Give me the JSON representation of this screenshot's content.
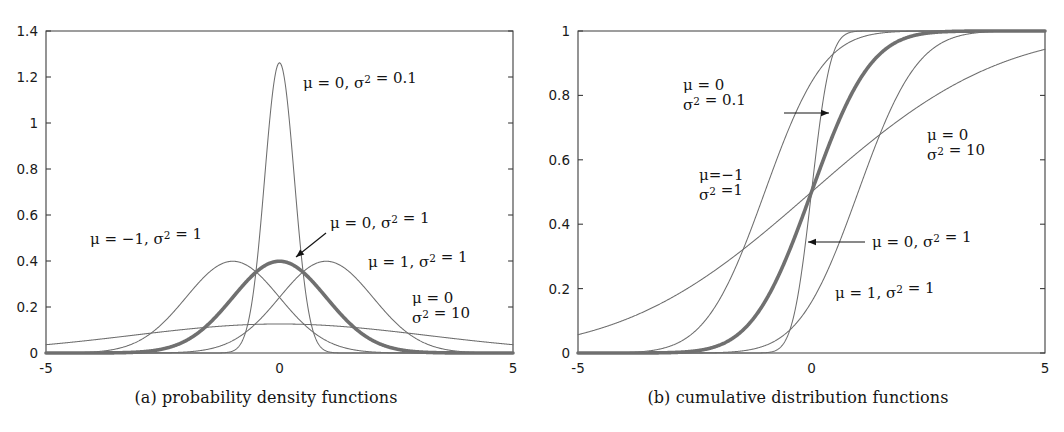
{
  "figure": {
    "panels": [
      {
        "id": "a",
        "caption": "(a) probability density functions"
      },
      {
        "id": "b",
        "caption": "(b) cumulative distribution functions"
      }
    ]
  },
  "chart_data": [
    {
      "type": "line",
      "panel": "a",
      "title": "(a) probability density functions",
      "xlabel": "",
      "ylabel": "",
      "xlim": [
        -5,
        5
      ],
      "ylim": [
        0,
        1.4
      ],
      "xticks": [
        -5,
        5
      ],
      "xtick_labels": [
        "-5",
        "5"
      ],
      "x_zero_label": "0",
      "yticks": [
        0,
        0.2,
        0.4,
        0.6,
        0.8,
        1,
        1.2,
        1.4
      ],
      "ytick_labels": [
        "0",
        "0.2",
        "0.4",
        "0.6",
        "0.8",
        "1",
        "1.2",
        "1.4"
      ],
      "grid": false,
      "legend": "none",
      "series": [
        {
          "name": "mu=0, sigma2=0.1",
          "mu": 0,
          "sigma2": 0.1,
          "emphasis": "thin",
          "peak": 1.2616
        },
        {
          "name": "mu=-1, sigma2=1",
          "mu": -1,
          "sigma2": 1,
          "emphasis": "thin",
          "peak": 0.3989
        },
        {
          "name": "mu=0, sigma2=1",
          "mu": 0,
          "sigma2": 1,
          "emphasis": "bold",
          "peak": 0.3989
        },
        {
          "name": "mu=1, sigma2=1",
          "mu": 1,
          "sigma2": 1,
          "emphasis": "thin",
          "peak": 0.3989
        },
        {
          "name": "mu=0, sigma2=10",
          "mu": 0,
          "sigma2": 10,
          "emphasis": "thin",
          "peak": 0.1262
        }
      ],
      "annotations": [
        {
          "id": "a-annot-narrow",
          "lines": [
            "μ = 0, σ² = 0.1"
          ],
          "x": 303,
          "y": 88,
          "anchor": "start",
          "arrow": null
        },
        {
          "id": "a-annot-mu-neg1",
          "lines": [
            "μ = −1, σ² = 1"
          ],
          "x": 90,
          "y": 244,
          "anchor": "start",
          "arrow": null
        },
        {
          "id": "a-annot-standard",
          "lines": [
            "μ = 0, σ² = 1"
          ],
          "x": 330,
          "y": 228,
          "anchor": "start",
          "arrow": {
            "x1": 326,
            "y1": 233,
            "x2": 296,
            "y2": 257
          }
        },
        {
          "id": "a-annot-mu1",
          "lines": [
            "μ = 1, σ² = 1"
          ],
          "x": 368,
          "y": 267,
          "anchor": "start",
          "arrow": null
        },
        {
          "id": "a-annot-wide",
          "lines": [
            "μ = 0",
            "σ² = 10"
          ],
          "x": 412,
          "y": 303,
          "anchor": "start",
          "arrow": null
        }
      ]
    },
    {
      "type": "line",
      "panel": "b",
      "title": "(b) cumulative distribution functions",
      "xlabel": "",
      "ylabel": "",
      "xlim": [
        -5,
        5
      ],
      "ylim": [
        0,
        1
      ],
      "xticks": [
        -5,
        5
      ],
      "xtick_labels": [
        "-5",
        "5"
      ],
      "x_zero_label": "0",
      "yticks": [
        0,
        0.2,
        0.4,
        0.6,
        0.8,
        1
      ],
      "ytick_labels": [
        "0",
        "0.2",
        "0.4",
        "0.6",
        "0.8",
        "1"
      ],
      "grid": false,
      "legend": "none",
      "series": [
        {
          "name": "mu=0, sigma2=0.1",
          "mu": 0,
          "sigma2": 0.1,
          "emphasis": "thin"
        },
        {
          "name": "mu=-1, sigma2=1",
          "mu": -1,
          "sigma2": 1,
          "emphasis": "thin"
        },
        {
          "name": "mu=0, sigma2=1",
          "mu": 0,
          "sigma2": 1,
          "emphasis": "bold"
        },
        {
          "name": "mu=1, sigma2=1",
          "mu": 1,
          "sigma2": 1,
          "emphasis": "thin"
        },
        {
          "name": "mu=0, sigma2=10",
          "mu": 0,
          "sigma2": 10,
          "emphasis": "thin"
        }
      ],
      "annotations": [
        {
          "id": "b-annot-narrow",
          "lines": [
            "μ = 0",
            "σ² = 0.1"
          ],
          "x": 151,
          "y": 90,
          "anchor": "start",
          "arrow": {
            "x1": 252,
            "y1": 113,
            "x2": 297,
            "y2": 113
          }
        },
        {
          "id": "b-annot-mu-neg1",
          "lines": [
            "μ=−1",
            "σ² =1"
          ],
          "x": 167,
          "y": 180,
          "anchor": "start",
          "arrow": null
        },
        {
          "id": "b-annot-wide",
          "lines": [
            "μ = 0",
            "σ² = 10"
          ],
          "x": 395,
          "y": 140,
          "anchor": "start",
          "arrow": null
        },
        {
          "id": "b-annot-standard",
          "lines": [
            "μ = 0, σ² = 1"
          ],
          "x": 340,
          "y": 247,
          "anchor": "start",
          "arrow": {
            "x1": 333,
            "y1": 242,
            "x2": 276,
            "y2": 242
          }
        },
        {
          "id": "b-annot-mu1",
          "lines": [
            "μ = 1, σ² = 1"
          ],
          "x": 303,
          "y": 298,
          "anchor": "start",
          "arrow": null
        }
      ]
    }
  ],
  "colors": {
    "axis": "#3c3c3c",
    "curve_thin": "#6e6e6e",
    "curve_bold": "#707070",
    "text": "#141414",
    "background": "#ffffff"
  }
}
